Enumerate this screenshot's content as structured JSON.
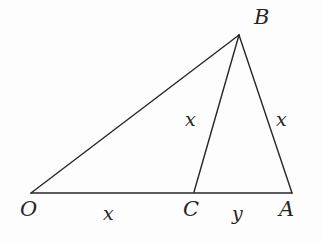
{
  "figure": {
    "kind": "geometry-diagram",
    "background_color": "#fdfdfd",
    "stroke_color": "#262626",
    "stroke_width": 1.4,
    "width": 322,
    "height": 242
  },
  "points": {
    "O": {
      "label": "O",
      "x": 31,
      "y": 193
    },
    "A": {
      "label": "A",
      "x": 292,
      "y": 193
    },
    "B": {
      "label": "B",
      "x": 239,
      "y": 35
    },
    "C": {
      "label": "C",
      "x": 194,
      "y": 192
    }
  },
  "segments": [
    {
      "name": "OB",
      "from": "O",
      "to": "B",
      "length_label": null
    },
    {
      "name": "OA",
      "from": "O",
      "to": "A",
      "length_label": null
    },
    {
      "name": "BA",
      "from": "B",
      "to": "A",
      "length_label": "x"
    },
    {
      "name": "BC",
      "from": "B",
      "to": "C",
      "length_label": "x"
    },
    {
      "name": "OC",
      "from": "O",
      "to": "C",
      "length_label": "x"
    },
    {
      "name": "CA",
      "from": "C",
      "to": "A",
      "length_label": "y"
    }
  ],
  "labels": {
    "vertex_B": "B",
    "vertex_O": "O",
    "vertex_C": "C",
    "vertex_A": "A",
    "side_bc": "x",
    "side_ab": "x",
    "side_oc": "x",
    "side_ca": "y"
  }
}
